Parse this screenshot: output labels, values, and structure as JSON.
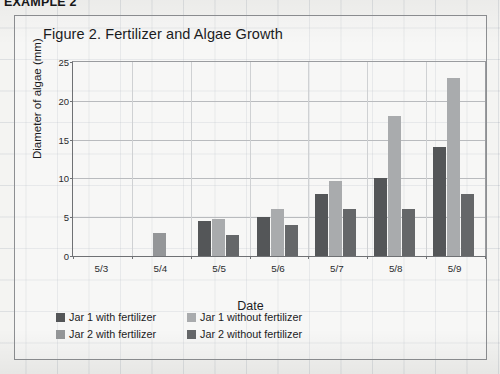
{
  "page": {
    "example_header": "EXAMPLE 2"
  },
  "chart_data": {
    "type": "bar",
    "title": "Figure 2. Fertilizer and Algae Growth",
    "xlabel": "Date",
    "ylabel": "Diameter of algae (mm)",
    "ylim": [
      0,
      25
    ],
    "yticks": [
      0,
      5,
      10,
      15,
      20,
      25
    ],
    "grid": true,
    "legend_position": "bottom-left",
    "categories": [
      "5/3",
      "5/4",
      "5/5",
      "5/6",
      "5/7",
      "5/8",
      "5/9"
    ],
    "series": [
      {
        "name": "Jar 1 with fertilizer",
        "color": "#545658",
        "values": [
          0,
          0,
          4.5,
          5.0,
          8.0,
          10.0,
          14.0
        ]
      },
      {
        "name": "Jar 1 without fertilizer",
        "color": "#a9abad",
        "values": [
          0,
          0,
          4.8,
          6.0,
          9.7,
          18.0,
          23.0
        ]
      },
      {
        "name": "Jar 2 with fertilizer",
        "color": "#949698",
        "values": [
          0,
          3.0,
          0,
          0,
          0,
          0,
          0
        ]
      },
      {
        "name": "Jar 2 without fertilizer",
        "color": "#656769",
        "values": [
          0,
          0,
          2.7,
          4.0,
          6.0,
          6.0,
          8.0
        ]
      }
    ]
  },
  "legend": {
    "items": [
      {
        "label": "Jar 1 with fertilizer",
        "color": "#545658"
      },
      {
        "label": "Jar 1 without fertilizer",
        "color": "#a9abad"
      },
      {
        "label": "Jar 2 with fertilizer",
        "color": "#949698"
      },
      {
        "label": "Jar 2 without fertilizer",
        "color": "#656769"
      }
    ]
  }
}
